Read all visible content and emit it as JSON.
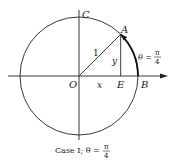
{
  "diagram": {
    "type": "unit-circle",
    "labels": {
      "origin": "O",
      "top": "C",
      "point_a": "A",
      "point_e": "E",
      "point_b": "B",
      "radius": "1",
      "x_segment": "x",
      "y_segment": "y",
      "theta_prefix": "θ =",
      "theta_num": "π",
      "theta_den": "4"
    },
    "caption": {
      "prefix": "Case I; θ =",
      "frac_num": "π",
      "frac_den": "4"
    },
    "angle_theta": "π/4",
    "colors": {
      "ink": "#222222",
      "background": "#ffffff"
    }
  }
}
